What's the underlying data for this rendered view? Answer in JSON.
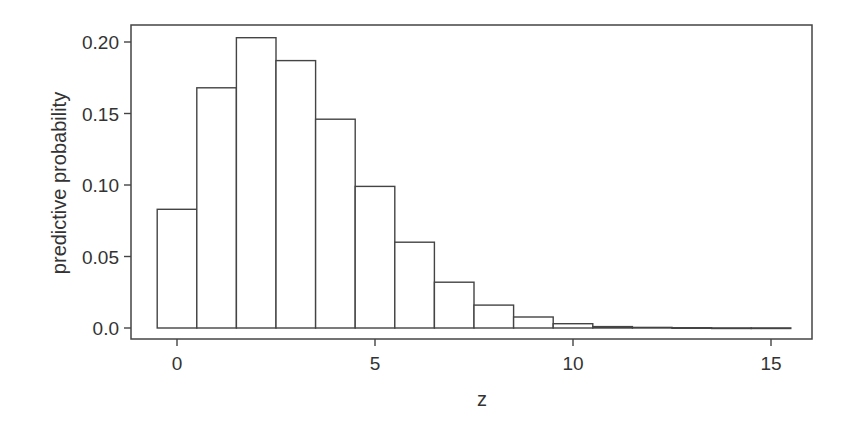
{
  "chart_data": {
    "type": "bar",
    "title": "",
    "xlabel": "z",
    "ylabel": "predictive probability",
    "x": [
      0,
      1,
      2,
      3,
      4,
      5,
      6,
      7,
      8,
      9,
      10,
      11,
      12,
      13,
      14,
      15
    ],
    "values": [
      0.083,
      0.168,
      0.203,
      0.187,
      0.146,
      0.099,
      0.06,
      0.032,
      0.016,
      0.0077,
      0.003,
      0.001,
      0.0004,
      0.0002,
      0.0001,
      5e-05
    ],
    "xlim": [
      -1.2,
      16.1
    ],
    "ylim": [
      -0.008,
      0.21
    ],
    "xticks": [
      0,
      5,
      10,
      15
    ],
    "xtick_labels": [
      "0",
      "5",
      "10",
      "15"
    ],
    "yticks": [
      0.0,
      0.05,
      0.1,
      0.15,
      0.2
    ],
    "ytick_labels": [
      "0.0",
      "0.05",
      "0.10",
      "0.15",
      "0.20"
    ],
    "grid": false,
    "legend": null,
    "bar_fill": "#ffffff",
    "bar_stroke": "#444444"
  }
}
